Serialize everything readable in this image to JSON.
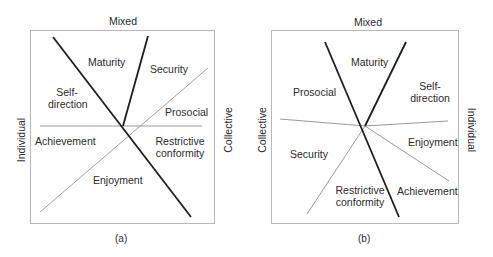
{
  "panels": [
    {
      "id": "a",
      "caption": "(a)",
      "axes": {
        "top": "Mixed",
        "left": "Individual",
        "right": "Collective"
      },
      "regions": {
        "maturity": "Maturity",
        "security": "Security",
        "self_direction_1": "Self-",
        "self_direction_2": "direction",
        "prosocial": "Prosocial",
        "achievement": "Achievement",
        "restrictive_1": "Restrictive",
        "restrictive_2": "conformity",
        "enjoyment": "Enjoyment"
      }
    },
    {
      "id": "b",
      "caption": "(b)",
      "axes": {
        "top": "Mixed",
        "left": "Collective",
        "right": "Individual"
      },
      "regions": {
        "maturity": "Maturity",
        "prosocial": "Prosocial",
        "self_direction_1": "Self-",
        "self_direction_2": "direction",
        "security": "Security",
        "enjoyment": "Enjoyment",
        "restrictive_1": "Restrictive",
        "restrictive_2": "conformity",
        "achievement": "Achievement"
      }
    }
  ],
  "colors": {
    "thick_line": "#1e1e1e",
    "thin_line": "#9a9a9a",
    "frame": "#b8b8b8"
  }
}
